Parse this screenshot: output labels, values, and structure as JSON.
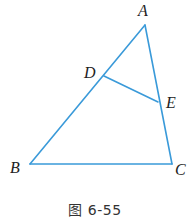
{
  "diagram": {
    "type": "geometry-triangle",
    "stroke_color": "#3a9ad9",
    "points": {
      "A": {
        "label": "A",
        "x": 145,
        "y": 25
      },
      "B": {
        "label": "B",
        "x": 30,
        "y": 164
      },
      "C": {
        "label": "C",
        "x": 172,
        "y": 164
      },
      "D": {
        "label": "D",
        "x": 104,
        "y": 76
      },
      "E": {
        "label": "E",
        "x": 158,
        "y": 102
      }
    },
    "segments": [
      [
        "A",
        "B"
      ],
      [
        "B",
        "C"
      ],
      [
        "C",
        "A"
      ],
      [
        "D",
        "E"
      ]
    ]
  },
  "labels": {
    "A": "A",
    "B": "B",
    "C": "C",
    "D": "D",
    "E": "E"
  },
  "caption": "图 6-55"
}
